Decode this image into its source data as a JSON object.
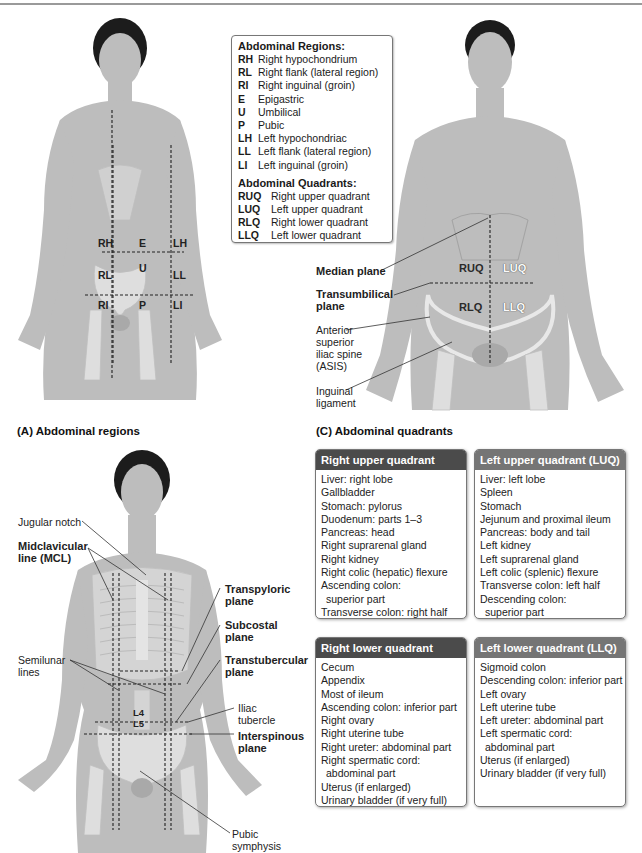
{
  "legend": {
    "regions_title": "Abdominal Regions:",
    "regions": [
      {
        "code": "RH",
        "name": "Right hypochondrium"
      },
      {
        "code": "RL",
        "name": "Right flank (lateral region)"
      },
      {
        "code": "RI",
        "name": "Right inguinal (groin)"
      },
      {
        "code": "E",
        "name": "Epigastric"
      },
      {
        "code": "U",
        "name": "Umbilical"
      },
      {
        "code": "P",
        "name": "Pubic"
      },
      {
        "code": "LH",
        "name": "Left hypochondriac"
      },
      {
        "code": "LL",
        "name": "Left flank (lateral region)"
      },
      {
        "code": "LI",
        "name": "Left inguinal (groin)"
      }
    ],
    "quadrants_title": "Abdominal Quadrants:",
    "quadrants": [
      {
        "code": "RUQ",
        "name": "Right upper quadrant"
      },
      {
        "code": "LUQ",
        "name": "Left upper quadrant"
      },
      {
        "code": "RLQ",
        "name": "Right lower quadrant"
      },
      {
        "code": "LLQ",
        "name": "Left lower quadrant"
      }
    ]
  },
  "figure_a": {
    "caption": "(A) Abdominal regions",
    "region_labels": {
      "RH": "RH",
      "E": "E",
      "LH": "LH",
      "RL": "RL",
      "U": "U",
      "LL": "LL",
      "RI": "RI",
      "P": "P",
      "LI": "LI"
    }
  },
  "figure_c": {
    "caption": "(C) Abdominal quadrants",
    "quadrant_labels": {
      "RUQ": "RUQ",
      "LUQ": "LUQ",
      "RLQ": "RLQ",
      "LLQ": "LLQ"
    },
    "callouts": {
      "median_plane": "Median plane",
      "transumbilical_1": "Transumbilical",
      "transumbilical_2": "plane",
      "asis_1": "Anterior",
      "asis_2": "superior",
      "asis_3": "iliac spine",
      "asis_4": "(ASIS)",
      "inguinal_1": "Inguinal",
      "inguinal_2": "ligament"
    }
  },
  "figure_b": {
    "callouts": {
      "jugular_notch": "Jugular notch",
      "mcl_1": "Midclavicular",
      "mcl_2": "line (MCL)",
      "transpyloric_1": "Transpyloric",
      "transpyloric_2": "plane",
      "subcostal_1": "Subcostal",
      "subcostal_2": "plane",
      "transtubercular_1": "Transtubercular",
      "transtubercular_2": "plane",
      "semilunar_1": "Semilunar",
      "semilunar_2": "lines",
      "iliac_1": "Iliac",
      "iliac_2": "tubercle",
      "interspinous_1": "Interspinous",
      "interspinous_2": "plane",
      "pubic_1": "Pubic",
      "pubic_2": "symphysis"
    },
    "vertebra_labels": {
      "L4": "L4",
      "L5": "L5"
    }
  },
  "quadrant_tables": {
    "ruq": {
      "title": "Right upper quadrant (RUQ)",
      "items": [
        "Liver: right lobe",
        "Gallbladder",
        "Stomach: pylorus",
        "Duodenum: parts 1–3",
        "Pancreas: head",
        "Right suprarenal gland",
        "Right kidney",
        "Right colic (hepatic) flexure",
        "Ascending colon:",
        "superior part",
        "Transverse colon: right half"
      ]
    },
    "luq": {
      "title": "Left upper quadrant (LUQ)",
      "items": [
        "Liver: left lobe",
        "Spleen",
        "Stomach",
        "Jejunum and proximal ileum",
        "Pancreas: body and tail",
        "Left kidney",
        "Left suprarenal gland",
        "Left colic (splenic) flexure",
        "Transverse colon: left half",
        "Descending colon:",
        "superior part"
      ]
    },
    "rlq": {
      "title": "Right lower quadrant (RLQ)",
      "items": [
        "Cecum",
        "Appendix",
        "Most of ileum",
        "Ascending colon: inferior part",
        "Right ovary",
        "Right uterine tube",
        "Right ureter: abdominal part",
        "Right spermatic cord:",
        "abdominal part",
        "Uterus (if enlarged)",
        "Urinary bladder (if very full)"
      ]
    },
    "llq": {
      "title": "Left lower quadrant (LLQ)",
      "items": [
        "Sigmoid colon",
        "Descending colon: inferior part",
        "Left ovary",
        "Left uterine tube",
        "Left ureter: abdominal part",
        "Left spermatic cord:",
        "abdominal part",
        "Uterus (if enlarged)",
        "Urinary bladder (if very full)"
      ]
    }
  },
  "colors": {
    "header_dark": "#4b4b4b",
    "header_light": "#757575",
    "skin": "#bdbdbd"
  }
}
